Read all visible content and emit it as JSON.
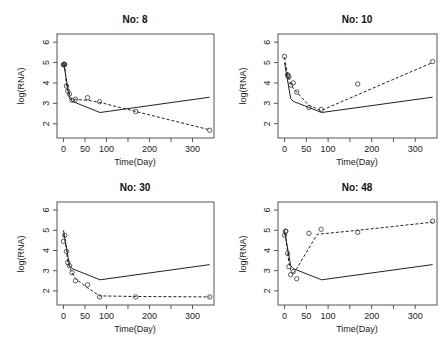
{
  "chart_data": [
    {
      "type": "line",
      "title": "No: 8",
      "xlabel": "Time(Day)",
      "ylabel": "log(RNA)",
      "xlim": [
        -15,
        350
      ],
      "ylim": [
        1.3,
        6.4
      ],
      "xticks": [
        0,
        50,
        100,
        150,
        200,
        250,
        300
      ],
      "xtick_labels": [
        "0",
        "50",
        "100",
        "",
        "200",
        "",
        "300"
      ],
      "yticks": [
        2,
        3,
        4,
        5,
        6
      ],
      "grid": false,
      "series": [
        {
          "name": "population fit",
          "style": "solid",
          "x": [
            0,
            14,
            20,
            85,
            340
          ],
          "y": [
            5.0,
            3.25,
            3.1,
            2.55,
            3.3
          ]
        },
        {
          "name": "individual fit",
          "style": "dashed",
          "x": [
            0,
            3,
            7,
            10,
            14,
            20,
            28,
            56,
            84,
            168,
            340
          ],
          "y": [
            4.9,
            4.9,
            3.85,
            3.6,
            3.45,
            3.15,
            3.2,
            3.15,
            3.05,
            2.6,
            1.7
          ]
        },
        {
          "name": "observed",
          "style": "points",
          "x": [
            0,
            1,
            2,
            3,
            7,
            10,
            14,
            20,
            28,
            56,
            84,
            168,
            340
          ],
          "y": [
            4.9,
            4.88,
            4.92,
            4.9,
            3.85,
            3.6,
            3.45,
            3.15,
            3.2,
            3.28,
            3.08,
            2.6,
            1.68
          ]
        }
      ]
    },
    {
      "type": "line",
      "title": "No: 10",
      "xlabel": "Time(Day)",
      "ylabel": "log(RNA)",
      "xlim": [
        -15,
        350
      ],
      "ylim": [
        1.3,
        6.4
      ],
      "xticks": [
        0,
        50,
        100,
        150,
        200,
        250,
        300
      ],
      "xtick_labels": [
        "0",
        "50",
        "100",
        "",
        "200",
        "",
        "300"
      ],
      "yticks": [
        2,
        3,
        4,
        5,
        6
      ],
      "grid": false,
      "series": [
        {
          "name": "population fit",
          "style": "solid",
          "x": [
            0,
            14,
            20,
            85,
            340
          ],
          "y": [
            5.0,
            3.25,
            3.1,
            2.55,
            3.3
          ]
        },
        {
          "name": "individual fit",
          "style": "dashed",
          "x": [
            0,
            7,
            10,
            14,
            20,
            28,
            56,
            84,
            340
          ],
          "y": [
            5.25,
            4.4,
            4.2,
            3.95,
            3.75,
            3.55,
            2.9,
            2.65,
            5.0
          ]
        },
        {
          "name": "observed",
          "style": "points",
          "x": [
            0,
            7,
            8,
            10,
            14,
            20,
            28,
            56,
            84,
            168,
            340
          ],
          "y": [
            5.3,
            4.4,
            4.35,
            4.3,
            3.9,
            4.0,
            3.55,
            2.8,
            2.7,
            3.95,
            5.05
          ]
        }
      ]
    },
    {
      "type": "line",
      "title": "No: 30",
      "xlabel": "Time(Day)",
      "ylabel": "log(RNA)",
      "xlim": [
        -15,
        350
      ],
      "ylim": [
        1.3,
        6.4
      ],
      "xticks": [
        0,
        50,
        100,
        150,
        200,
        250,
        300
      ],
      "xtick_labels": [
        "0",
        "50",
        "100",
        "",
        "200",
        "",
        "300"
      ],
      "yticks": [
        2,
        3,
        4,
        5,
        6
      ],
      "grid": false,
      "series": [
        {
          "name": "population fit",
          "style": "solid",
          "x": [
            0,
            14,
            20,
            85,
            340
          ],
          "y": [
            5.0,
            3.25,
            3.1,
            2.55,
            3.3
          ]
        },
        {
          "name": "individual fit",
          "style": "dashed",
          "x": [
            0,
            3,
            7,
            10,
            14,
            20,
            28,
            56,
            84,
            168,
            340
          ],
          "y": [
            4.8,
            4.6,
            4.0,
            3.4,
            3.2,
            2.9,
            2.6,
            2.15,
            1.75,
            1.72,
            1.7
          ]
        },
        {
          "name": "observed",
          "style": "points",
          "x": [
            0,
            3,
            7,
            10,
            14,
            20,
            28,
            56,
            84,
            168,
            340
          ],
          "y": [
            4.45,
            4.75,
            3.95,
            3.4,
            3.25,
            2.9,
            2.5,
            2.3,
            1.7,
            1.7,
            1.7
          ]
        }
      ]
    },
    {
      "type": "line",
      "title": "No: 48",
      "xlabel": "Time(Day)",
      "ylabel": "log(RNA)",
      "xlim": [
        -15,
        350
      ],
      "ylim": [
        1.3,
        6.4
      ],
      "xticks": [
        0,
        50,
        100,
        150,
        200,
        250,
        300
      ],
      "xtick_labels": [
        "0",
        "50",
        "100",
        "",
        "200",
        "",
        "300"
      ],
      "yticks": [
        2,
        3,
        4,
        5,
        6
      ],
      "grid": false,
      "series": [
        {
          "name": "population fit",
          "style": "solid",
          "x": [
            0,
            14,
            20,
            85,
            340
          ],
          "y": [
            5.0,
            3.25,
            3.1,
            2.55,
            3.3
          ]
        },
        {
          "name": "individual fit",
          "style": "dashed",
          "x": [
            0,
            3,
            7,
            10,
            14,
            20,
            28,
            75,
            168,
            340
          ],
          "y": [
            4.85,
            4.6,
            3.9,
            3.4,
            3.05,
            2.9,
            3.1,
            4.8,
            5.0,
            5.4
          ]
        },
        {
          "name": "observed",
          "style": "points",
          "x": [
            0,
            2,
            3,
            7,
            10,
            14,
            20,
            28,
            56,
            84,
            168,
            340
          ],
          "y": [
            4.75,
            4.95,
            4.95,
            3.85,
            3.2,
            2.8,
            2.95,
            2.6,
            4.85,
            5.05,
            4.9,
            5.45
          ]
        }
      ]
    }
  ],
  "panels": [
    {
      "title": "No: 8",
      "xlabel": "Time(Day)",
      "ylabel": "log(RNA)"
    },
    {
      "title": "No: 10",
      "xlabel": "Time(Day)",
      "ylabel": "log(RNA)"
    },
    {
      "title": "No: 30",
      "xlabel": "Time(Day)",
      "ylabel": "log(RNA)"
    },
    {
      "title": "No: 48",
      "xlabel": "Time(Day)",
      "ylabel": "log(RNA)"
    }
  ],
  "colors": {
    "line": "#222222",
    "frame": "#555555",
    "points": "#333333"
  }
}
